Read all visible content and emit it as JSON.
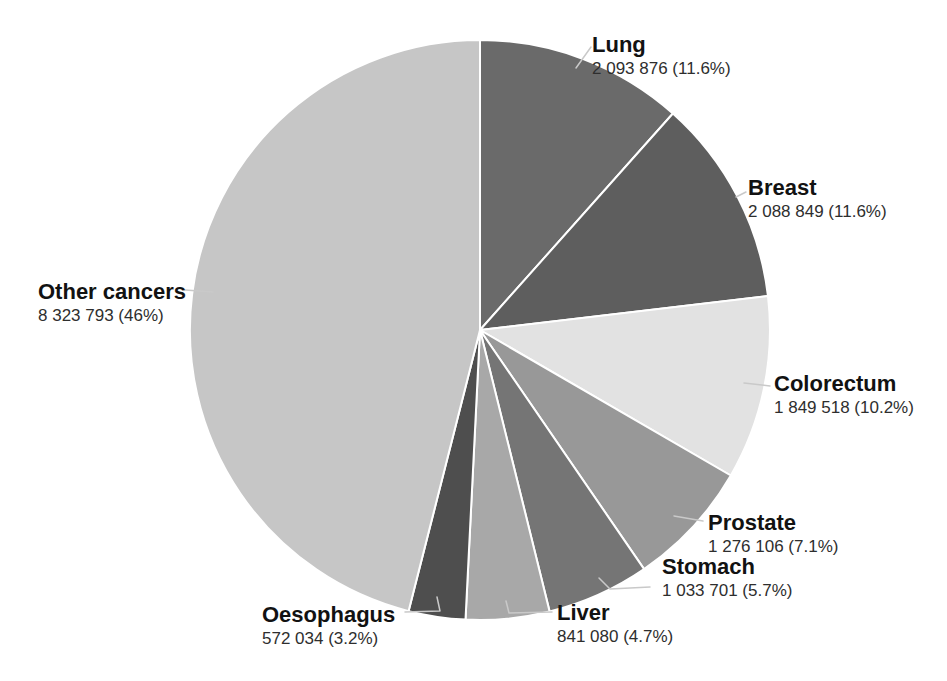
{
  "chart_data": {
    "type": "pie",
    "title": "",
    "start_angle_deg": 0,
    "direction": "clockwise",
    "label_style": "callout",
    "legend_position": "none",
    "slices": [
      {
        "label": "Lung",
        "value": 2093876,
        "pct": 11.6,
        "value_text": "2 093 876 (11.6%)",
        "color": "#6a6a6a",
        "callout": {
          "x": 592,
          "y": 32,
          "leader": [
            [
              591,
              47
            ],
            [
              576,
              68
            ]
          ]
        }
      },
      {
        "label": "Breast",
        "value": 2088849,
        "pct": 11.6,
        "value_text": "2 088 849 (11.6%)",
        "color": "#5e5e5e",
        "callout": {
          "x": 748,
          "y": 175,
          "leader": [
            [
              746,
              192
            ],
            [
              736,
              197
            ]
          ]
        }
      },
      {
        "label": "Colorectum",
        "value": 1849518,
        "pct": 10.2,
        "value_text": "1 849 518 (10.2%)",
        "color": "#e2e2e2",
        "callout": {
          "x": 774,
          "y": 371,
          "leader": [
            [
              770,
              386
            ],
            [
              744,
              383
            ]
          ]
        }
      },
      {
        "label": "Prostate",
        "value": 1276106,
        "pct": 7.1,
        "value_text": "1 276 106 (7.1%)",
        "color": "#989898",
        "callout": {
          "x": 708,
          "y": 510,
          "leader": [
            [
              703,
              521
            ],
            [
              674,
              516
            ]
          ]
        }
      },
      {
        "label": "Stomach",
        "value": 1033701,
        "pct": 5.7,
        "value_text": "1 033 701 (5.7%)",
        "color": "#757575",
        "callout": {
          "x": 662,
          "y": 554,
          "leader": [
            [
              650,
              587
            ],
            [
              610,
              589
            ],
            [
              599,
              578
            ]
          ]
        }
      },
      {
        "label": "Liver",
        "value": 841080,
        "pct": 4.7,
        "value_text": "841 080 (4.7%)",
        "color": "#a8a8a8",
        "callout": {
          "x": 557,
          "y": 600,
          "leader": [
            [
              552,
              612
            ],
            [
              509,
              613
            ],
            [
              506,
              601
            ]
          ]
        }
      },
      {
        "label": "Oesophagus",
        "value": 572034,
        "pct": 3.2,
        "value_text": "572 034 (3.2%)",
        "color": "#4e4e4e",
        "callout": {
          "x": 262,
          "y": 602,
          "leader": [
            [
              405,
              612
            ],
            [
              440,
              611
            ],
            [
              437,
              597
            ]
          ]
        }
      },
      {
        "label": "Other cancers",
        "value": 8323793,
        "pct": 46,
        "value_text": "8 323 793 (46%)",
        "color": "#c6c6c6",
        "callout": {
          "x": 38,
          "y": 279,
          "leader": [
            [
              185,
              290
            ],
            [
              213,
              292
            ]
          ]
        }
      }
    ]
  }
}
